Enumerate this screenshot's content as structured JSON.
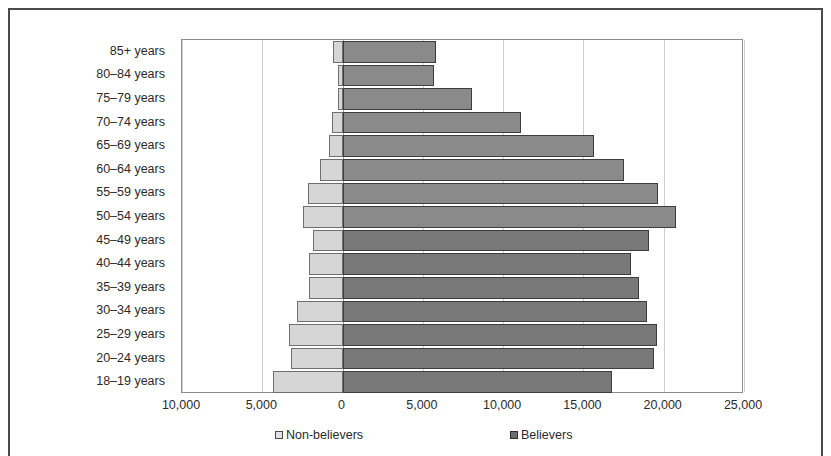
{
  "chart_data": {
    "type": "bar",
    "subtype": "population-pyramid",
    "title": "",
    "xlabel": "",
    "ylabel": "",
    "orientation": "horizontal",
    "grid": true,
    "legend_position": "bottom",
    "xlim": [
      -10000,
      25000
    ],
    "x_ticks": [
      -10000,
      -5000,
      0,
      5000,
      10000,
      15000,
      20000,
      25000
    ],
    "x_tick_labels": [
      "10,000",
      "5,000",
      "0",
      "5,000",
      "10,000",
      "15,000",
      "20,000",
      "25,000"
    ],
    "categories": [
      "85+ years",
      "80–84 years",
      "75–79 years",
      "70–74 years",
      "65–69 years",
      "60–64 years",
      "55–59 years",
      "50–54 years",
      "45–49 years",
      "40–44 years",
      "35–39 years",
      "30–34 years",
      "25–29 years",
      "20–24 years",
      "18–19 years"
    ],
    "series": [
      {
        "name": "Non-believers",
        "side": "left",
        "color": "#d6d6d6",
        "border_color": "#6f6f6f",
        "values": [
          600,
          300,
          300,
          660,
          860,
          1400,
          2170,
          2480,
          1840,
          2090,
          2090,
          2840,
          3340,
          3210,
          4340
        ]
      },
      {
        "name": "Believers",
        "side": "right",
        "color": "#8a8a8a",
        "border_color": "#3d3d3d",
        "values": [
          5800,
          5700,
          8060,
          11100,
          15650,
          17520,
          19650,
          20770,
          19100,
          17960,
          18460,
          18960,
          19580,
          19400,
          16800
        ]
      }
    ]
  },
  "legend": {
    "entries": [
      {
        "label": "Non-believers",
        "swatch": "light"
      },
      {
        "label": "Believers",
        "swatch": "dark"
      }
    ]
  }
}
